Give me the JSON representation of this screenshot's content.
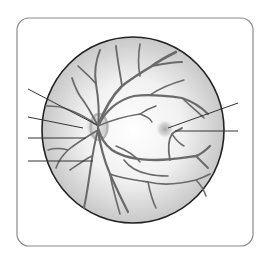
{
  "diagram": {
    "labels_visible": false,
    "frame": {
      "x": 17,
      "y": 18,
      "w": 236,
      "h": 228,
      "r": 12,
      "stroke": "#8a8a8a"
    },
    "fundus": {
      "cx": 133,
      "cy": 130,
      "rx": 91,
      "ry": 93,
      "stroke": "#222222",
      "fill_center": "#ffffff",
      "fill_edge": "#c8c8c8"
    },
    "optic_disc": {
      "cx": 98,
      "cy": 127,
      "r": 12,
      "color": "#b5b5b5"
    },
    "macula": {
      "cx": 165,
      "cy": 129,
      "r": 9,
      "color": "#a8a8a8"
    },
    "vessel_color": "#6a6a6a",
    "leader_color": "#333333",
    "leader_lines": [
      {
        "id": "left-1",
        "x1": 28,
        "y1": 89,
        "x2": 97,
        "y2": 125
      },
      {
        "id": "left-2",
        "x1": 28,
        "y1": 117,
        "x2": 83,
        "y2": 128
      },
      {
        "id": "left-3",
        "x1": 28,
        "y1": 138,
        "x2": 86,
        "y2": 138
      },
      {
        "id": "left-4",
        "x1": 28,
        "y1": 161,
        "x2": 93,
        "y2": 161
      },
      {
        "id": "right-1",
        "x1": 238,
        "y1": 103,
        "x2": 168,
        "y2": 128
      },
      {
        "id": "right-2",
        "x1": 238,
        "y1": 131,
        "x2": 175,
        "y2": 131
      }
    ],
    "vessels": [
      {
        "w": 2.6,
        "d": "M98 126 C104 110 112 96 122 86 C132 78 142 72 152 66 C160 60 168 56 176 52"
      },
      {
        "w": 2.0,
        "d": "M152 66 C162 64 172 62 182 62"
      },
      {
        "w": 1.8,
        "d": "M122 86 C120 72 117 58 116 46"
      },
      {
        "w": 1.6,
        "d": "M140 76 C138 66 138 56 140 44"
      },
      {
        "w": 2.2,
        "d": "M98 126 C106 110 118 100 134 96 C150 94 168 96 182 98 C194 102 202 108 208 114"
      },
      {
        "w": 1.6,
        "d": "M182 98 C188 104 196 110 204 118"
      },
      {
        "w": 1.4,
        "d": "M150 95 C160 88 170 84 184 80"
      },
      {
        "w": 2.0,
        "d": "M98 126 C100 110 98 96 96 84 C94 72 96 60 100 50"
      },
      {
        "w": 1.6,
        "d": "M96 84 C90 76 84 72 78 66"
      },
      {
        "w": 1.8,
        "d": "M98 126 C92 114 86 104 80 96 C76 90 74 84 72 78"
      },
      {
        "w": 1.6,
        "d": "M98 126 C88 118 76 112 64 108 C58 106 52 106 46 106"
      },
      {
        "w": 1.4,
        "d": "M98 126 C112 120 126 116 140 114 C146 116 150 118 152 122"
      },
      {
        "w": 1.4,
        "d": "M140 114 C146 110 150 108 156 106"
      },
      {
        "w": 2.4,
        "d": "M98 128 C100 136 104 144 112 150 C124 158 140 160 156 160 C170 160 182 158 196 156 C202 154 206 150 210 146"
      },
      {
        "w": 2.0,
        "d": "M196 156 C200 160 204 164 208 168"
      },
      {
        "w": 1.8,
        "d": "M170 160 C168 150 168 140 172 134 C176 130 180 130 182 128"
      },
      {
        "w": 1.4,
        "d": "M172 134 C176 140 180 144 184 146"
      },
      {
        "w": 2.2,
        "d": "M98 130 C100 144 104 160 110 174 C116 188 122 200 128 212"
      },
      {
        "w": 1.8,
        "d": "M110 174 C120 178 134 180 148 182 C164 186 180 184 196 180 C202 178 206 176 210 174"
      },
      {
        "w": 1.6,
        "d": "M196 180 C200 184 204 190 206 196"
      },
      {
        "w": 1.6,
        "d": "M110 174 C112 186 116 200 120 214"
      },
      {
        "w": 1.6,
        "d": "M148 182 C150 192 152 200 156 208"
      },
      {
        "w": 1.6,
        "d": "M124 160 C130 168 138 172 148 174 C156 176 162 176 168 176"
      },
      {
        "w": 2.0,
        "d": "M98 130 C94 144 92 158 90 172 C88 186 86 198 84 208"
      },
      {
        "w": 1.6,
        "d": "M92 156 C84 160 76 166 70 170"
      },
      {
        "w": 1.6,
        "d": "M98 130 C88 136 78 142 68 150 C62 156 58 162 56 168"
      },
      {
        "w": 1.4,
        "d": "M68 150 C60 148 54 148 48 150"
      },
      {
        "w": 1.4,
        "d": "M116 146 C126 150 134 154 140 162"
      }
    ]
  }
}
